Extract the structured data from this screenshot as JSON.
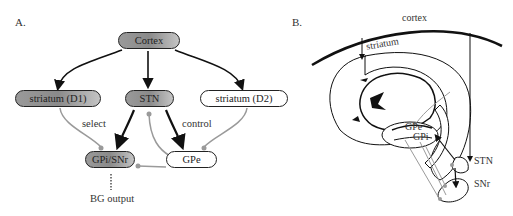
{
  "panel_a": {
    "label": "A.",
    "nodes": {
      "cortex": "Cortex",
      "striatum_d1": "striatum (D1)",
      "stn": "STN",
      "striatum_d2": "striatum (D2)",
      "gpi_snr": "GPi/SNr",
      "gpe": "GPe"
    },
    "edge_labels": {
      "select": "select",
      "control": "control",
      "output": "BG output"
    }
  },
  "panel_b": {
    "label": "B.",
    "structures": {
      "cortex": "cortex",
      "striatum": "striatum",
      "gpe": "GPe",
      "gpi": "GPi",
      "stn": "STN",
      "snr": "SNr"
    }
  },
  "colors": {
    "excitatory": "#111111",
    "inhibitory": "#9a9a9a",
    "dark_node": "#8e8e8e"
  }
}
